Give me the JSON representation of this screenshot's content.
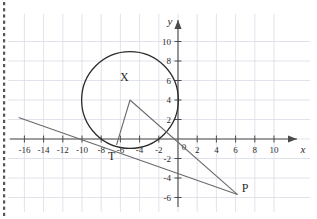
{
  "figure": {
    "type": "geometry-diagram",
    "axes": {
      "x_axis_label": "x",
      "y_axis_label": "y",
      "x_ticks": [
        "-16",
        "-14",
        "-12",
        "-10",
        "-8",
        "-6",
        "-4",
        "-2",
        "2",
        "4",
        "6",
        "8",
        "10"
      ],
      "x_tick_values": [
        -16,
        -14,
        -12,
        -10,
        -8,
        -6,
        -4,
        -2,
        2,
        4,
        6,
        8,
        10
      ],
      "y_ticks": [
        "10",
        "8",
        "6",
        "4",
        "2",
        "-2",
        "-4",
        "-6"
      ],
      "y_tick_values": [
        10,
        8,
        6,
        4,
        2,
        -2,
        -4,
        -6
      ],
      "origin_label": "0",
      "xlim": [
        -17.5,
        11.5
      ],
      "ylim": [
        -7.2,
        11.5
      ],
      "grid": true,
      "grid_step": 2
    },
    "colors": {
      "grid": "#d8dce6",
      "axis": "#4a4a4a",
      "curve": "#2b2b2b",
      "line": "#6a6a6a",
      "text": "#2b2b2b",
      "background": "#ffffff",
      "perforation": "#555555"
    },
    "circle": {
      "center_x": -5,
      "center_y": 4,
      "radius": 5,
      "label": "X"
    },
    "points": [
      {
        "id": "X",
        "label": "X",
        "x": -5,
        "y": 4,
        "label_dx": -0.6,
        "label_dy": 1.9
      },
      {
        "id": "T",
        "label": "T",
        "x": -6.4,
        "y": -0.6,
        "label_dx": -0.5,
        "label_dy": -1.6
      },
      {
        "id": "P",
        "label": "P",
        "x": 6.2,
        "y": -5.7,
        "label_dx": 0.8,
        "label_dy": 0.3
      }
    ],
    "segments": [
      {
        "id": "XT",
        "from": "X",
        "to": "T"
      },
      {
        "id": "XP",
        "from": "X",
        "to": "P"
      }
    ],
    "tangent_line": {
      "id": "tangent-through-T-and-P",
      "x1": -16.6,
      "y1": 2.2,
      "x2": 6.2,
      "y2": -5.7
    }
  }
}
